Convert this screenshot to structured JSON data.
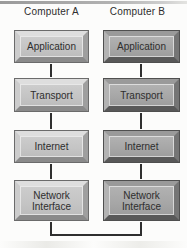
{
  "diagram": {
    "title_bar": {
      "present": true
    },
    "computers": [
      {
        "name": "Computer A",
        "theme": "light",
        "layers": [
          "Application",
          "Transport",
          "Internet",
          "Network Interface"
        ]
      },
      {
        "name": "Computer B",
        "theme": "dark",
        "layers": [
          "Application",
          "Transport",
          "Internet",
          "Network Interface"
        ]
      }
    ],
    "connections": [
      "Application-Transport (vertical, both columns)",
      "Transport-Internet (vertical, both columns)",
      "Internet-Network Interface (vertical, both columns)",
      "Network Interface A - Network Interface B (bottom U-shaped link)"
    ]
  },
  "colors": {
    "background": "#fcfcfb",
    "top_bar": "#a6a6a6",
    "line": "#2f2f2f",
    "text": "#2e2e2e",
    "box_a_face": "#c4c4c4",
    "box_a_bevel_top": "#dedede",
    "box_a_bevel_left": "#cccccc",
    "box_a_bevel_right": "#9f9f9f",
    "box_a_bevel_bottom": "#8a8a8a",
    "box_a_outline": "#6b6b6b",
    "box_b_face": "#a6a6a6",
    "box_b_bevel_top": "#9a9a9a",
    "box_b_bevel_left": "#b3b3b3",
    "box_b_bevel_right": "#757575",
    "box_b_bevel_bottom": "#585858",
    "box_b_outline": "#4f4f4f"
  }
}
